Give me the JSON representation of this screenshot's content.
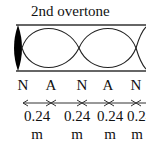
{
  "diagram": {
    "title": "2nd overtone",
    "tube": {
      "closed_end": "left",
      "open_end": "right",
      "loops_visible": 2
    },
    "node_labels": [
      "N",
      "A",
      "N",
      "A",
      "N"
    ],
    "segments": [
      {
        "value": "0.24",
        "unit": "m"
      },
      {
        "value": "0.24",
        "unit": "m"
      },
      {
        "value": "0.24",
        "unit": "m"
      },
      {
        "value": "0.24",
        "unit": "m"
      }
    ],
    "colors": {
      "line": "#222222",
      "fill": "#000000"
    }
  }
}
